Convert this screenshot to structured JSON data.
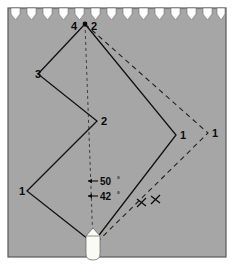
{
  "figure": {
    "name": "tacking-course-diagram",
    "background_color": "#a6a6a6",
    "paper_color": "#ffffff",
    "frame_color": "#5a5a5a",
    "line_color": "#111111",
    "vessel_color": "#f7f7f2",
    "top_edge": {
      "style": "perforated-notched",
      "notch_count": 13,
      "notch_color": "#ffffff"
    },
    "waypoint_labels": [
      {
        "id": "apex-4",
        "text": "4",
        "x": 74,
        "y": 30
      },
      {
        "id": "apex-2",
        "text": "2",
        "x": 94,
        "y": 30
      },
      {
        "id": "left-3",
        "text": "3",
        "x": 38,
        "y": 74
      },
      {
        "id": "mid-2",
        "text": "2",
        "x": 98,
        "y": 122
      },
      {
        "id": "left-1",
        "text": "1",
        "x": 27,
        "y": 192
      },
      {
        "id": "right-1-solid",
        "text": "1",
        "x": 180,
        "y": 136
      },
      {
        "id": "right-1-dashed",
        "text": "1",
        "x": 213,
        "y": 134
      }
    ],
    "angle_labels": [
      {
        "id": "angle-50",
        "value": "50",
        "unit": "°",
        "x": 100,
        "y": 184
      },
      {
        "id": "angle-42",
        "value": "42",
        "unit": "°",
        "x": 100,
        "y": 199
      }
    ],
    "solid_path": {
      "id": "solid-tacking-track",
      "points": [
        [
          93,
          243
        ],
        [
          27,
          191
        ],
        [
          97,
          121
        ],
        [
          38,
          74
        ],
        [
          85,
          24
        ]
      ]
    },
    "solid_path_right": {
      "id": "solid-tacking-track-right",
      "points": [
        [
          93,
          243
        ],
        [
          176,
          135
        ],
        [
          85,
          24
        ]
      ]
    },
    "dashed_paths": [
      {
        "id": "centerline",
        "points": [
          [
            85,
            24
          ],
          [
            93,
            243
          ]
        ]
      },
      {
        "id": "dashed-outer-track",
        "points": [
          [
            85,
            24
          ],
          [
            208,
            133
          ],
          [
            94,
            245
          ]
        ]
      }
    ],
    "tick_marks": [
      {
        "id": "tick-inner",
        "x": 142,
        "y": 203
      },
      {
        "id": "tick-outer",
        "x": 156,
        "y": 200
      }
    ],
    "vessel": {
      "id": "sailboat-marker",
      "x": 93,
      "y": 245
    }
  }
}
